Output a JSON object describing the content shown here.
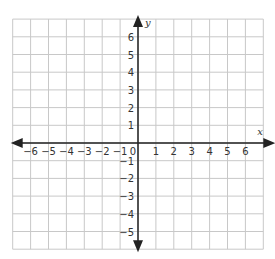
{
  "diagram": {
    "type": "coordinate-plane",
    "x_axis": {
      "label": "x",
      "min": -6,
      "max": 6,
      "ticks": [
        "-6",
        "-5",
        "-4",
        "-3",
        "-2",
        "-1",
        "0",
        "1",
        "2",
        "3",
        "4",
        "5",
        "6"
      ]
    },
    "y_axis": {
      "label": "y",
      "min": -5,
      "max": 6,
      "ticks": [
        "6",
        "5",
        "4",
        "3",
        "2",
        "1",
        "-1",
        "-2",
        "-3",
        "-4",
        "-5"
      ]
    },
    "grid": {
      "cols_left": 7,
      "cols_right": 7,
      "rows_above": 7,
      "rows_below": 6
    },
    "colors": {
      "grid": "#c8c8c8",
      "axis": "#222222",
      "text": "#333333",
      "background": "#ffffff"
    }
  }
}
